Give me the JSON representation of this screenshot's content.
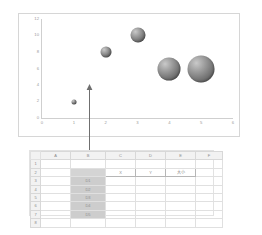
{
  "chart": {
    "panel_name": "bubble-chart",
    "background": "#ffffff",
    "border_color": "#d6d6d6"
  },
  "chart_data": {
    "type": "scatter",
    "title": "",
    "xlabel": "",
    "ylabel": "",
    "xlim": [
      0,
      6
    ],
    "ylim": [
      0,
      12
    ],
    "xticks": [
      "0",
      "1",
      "2",
      "3",
      "4",
      "5",
      "6"
    ],
    "yticks": [
      "0",
      "2",
      "4",
      "6",
      "8",
      "10",
      "12"
    ],
    "grid": false,
    "legend": "none",
    "bubble_color": "#7b7b7b",
    "series": [
      {
        "name": "D",
        "points": [
          {
            "label": "D1",
            "x": 1,
            "y": 2,
            "size": 5
          },
          {
            "label": "D2",
            "x": 2,
            "y": 8,
            "size": 11
          },
          {
            "label": "D3",
            "x": 3,
            "y": 10,
            "size": 15
          },
          {
            "label": "D4",
            "x": 4,
            "y": 6,
            "size": 23
          },
          {
            "label": "D5",
            "x": 5,
            "y": 6,
            "size": 27
          }
        ]
      }
    ]
  },
  "connector": {
    "name": "chart-to-data-arrow",
    "color": "#6f6f6f"
  },
  "sheet": {
    "columns": [
      "A",
      "B",
      "C",
      "D",
      "E",
      "F"
    ],
    "rows": [
      "1",
      "2",
      "3",
      "4",
      "5",
      "6",
      "7",
      "8"
    ],
    "header_row": {
      "b": "",
      "c": "X",
      "d": "Y",
      "e": "大小"
    },
    "selected_labels": [
      "D1",
      "D2",
      "D3",
      "D4",
      "D5"
    ],
    "selection_range": "B2:B7",
    "selection_fill": "#cdcdcd",
    "selection_border": "#6e6e6e"
  }
}
